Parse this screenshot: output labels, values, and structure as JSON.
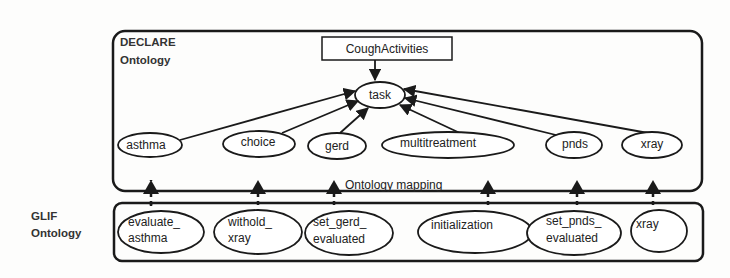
{
  "declare": {
    "title_line1": "DECLARE",
    "title_line2": "Ontology",
    "root_box": "CoughActivities",
    "task": "task",
    "nodes": [
      "asthma",
      "choice",
      "gerd",
      "multitreatment",
      "pnds",
      "xray"
    ]
  },
  "mapping_label": "Ontology mapping",
  "glif": {
    "title_line1": "GLIF",
    "title_line2": "Ontology",
    "nodes": [
      {
        "line1": "evaluate_",
        "line2": "asthma"
      },
      {
        "line1": "withold_",
        "line2": "xray"
      },
      {
        "line1": "set_gerd_",
        "line2": "evaluated"
      },
      {
        "line1": "initialization",
        "line2": ""
      },
      {
        "line1": "set_pnds_",
        "line2": "evaluated"
      },
      {
        "line1": "xray",
        "line2": ""
      }
    ]
  },
  "colors": {
    "stroke": "#1a1a1a",
    "background": "#fdfdfc"
  }
}
